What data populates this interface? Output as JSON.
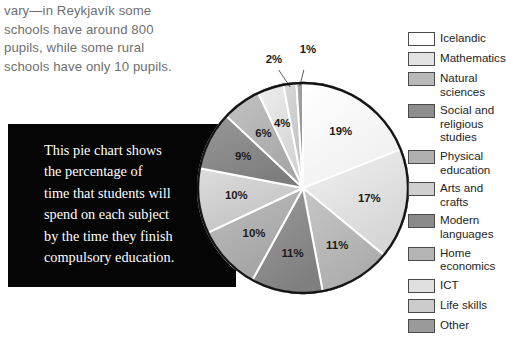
{
  "body_text": {
    "lines": [
      "vary—in Reykjavík some",
      "schools have around 800",
      "pupils, while some rural",
      "schools have only 10 pupils."
    ]
  },
  "callout": {
    "lines": [
      "This pie chart shows",
      "the percentage of",
      "time that students will",
      "spend on each subject",
      "by the time they finish",
      "compulsory education."
    ]
  },
  "chart_data": {
    "type": "pie",
    "title": "",
    "legend_position": "right",
    "start_angle_deg": 0,
    "direction": "clockwise",
    "categories": [
      "Icelandic",
      "Mathematics",
      "Natural sciences",
      "Social and religious studies",
      "Physical education",
      "Arts and crafts",
      "Modern languages",
      "Home economics",
      "ICT",
      "Life skills",
      "Other"
    ],
    "values": [
      19,
      17,
      11,
      11,
      10,
      10,
      9,
      6,
      4,
      2,
      1
    ],
    "value_labels": [
      "19%",
      "17%",
      "11%",
      "11%",
      "10%",
      "10%",
      "9%",
      "6%",
      "4%",
      "2%",
      "1%"
    ],
    "colors": [
      "#fdfdfd",
      "#e3e3e3",
      "#b9b9b9",
      "#8d8d8d",
      "#b0b0b0",
      "#cfcfcf",
      "#8a8a8a",
      "#b4b4b4",
      "#e0e0e0",
      "#cccccc",
      "#9a9a9a"
    ],
    "slice_border_color": "#ffffff",
    "outline_color": "#1a1a1a",
    "units": "percent of time"
  },
  "legend": {
    "items": [
      {
        "label": "Icelandic",
        "color": "#fdfdfd"
      },
      {
        "label": "Mathematics",
        "color": "#e3e3e3"
      },
      {
        "label": "Natural\nsciences",
        "color": "#b9b9b9"
      },
      {
        "label": "Social and\nreligious\nstudies",
        "color": "#8d8d8d"
      },
      {
        "label": "Physical\neducation",
        "color": "#b0b0b0"
      },
      {
        "label": "Arts and\ncrafts",
        "color": "#cfcfcf"
      },
      {
        "label": "Modern\nlanguages",
        "color": "#8a8a8a"
      },
      {
        "label": "Home\neconomics",
        "color": "#b4b4b4"
      },
      {
        "label": "ICT",
        "color": "#e0e0e0"
      },
      {
        "label": "Life skills",
        "color": "#cccccc"
      },
      {
        "label": "Other",
        "color": "#9a9a9a"
      }
    ]
  },
  "callout_labels": {
    "tiny": [
      "2%",
      "1%"
    ]
  }
}
